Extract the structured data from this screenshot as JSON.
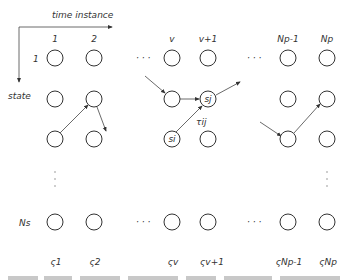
{
  "axes": {
    "time_label": "time instance",
    "state_label": "state"
  },
  "columns": [
    {
      "label": "1",
      "x": 55,
      "sigma": "ς1"
    },
    {
      "label": "2",
      "x": 94,
      "sigma": "ς2"
    },
    {
      "label": "v",
      "x": 172,
      "sigma": "ςv"
    },
    {
      "label": "v+1",
      "x": 208,
      "sigma": "ςv+1"
    },
    {
      "label": "Np-1",
      "x": 288,
      "sigma": "ςNp-1"
    },
    {
      "label": "Np",
      "x": 327,
      "sigma": "ςNp"
    }
  ],
  "rows": [
    {
      "label": "1",
      "y": 58
    },
    {
      "label": "",
      "y": 99
    },
    {
      "label": "",
      "y": 139
    },
    {
      "label": "Ns",
      "y": 222
    }
  ],
  "node_labels": {
    "si": "si",
    "sj": "sj",
    "tij": "τij"
  },
  "ellipsis": "· · ·",
  "vertical_ellipsis": "⋮"
}
